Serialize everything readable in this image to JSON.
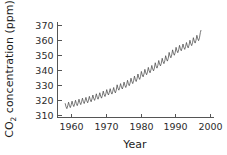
{
  "chart_data": {
    "type": "line",
    "title": "",
    "subtitle": "",
    "xlabel": "Year",
    "ylabel": "CO2 concentration (ppm)",
    "ylabel_main": "CO",
    "ylabel_sub": "2",
    "ylabel_rest": " concentration (ppm)",
    "xlim": [
      1956,
      2001
    ],
    "ylim": [
      308,
      372
    ],
    "xticks": [
      1960,
      1970,
      1980,
      1990,
      2000
    ],
    "yticks": [
      310,
      320,
      330,
      340,
      350,
      360,
      370
    ],
    "xtick_labels": [
      "1960",
      "1970",
      "1980",
      "1990",
      "2000"
    ],
    "ytick_labels": [
      "310",
      "320",
      "330",
      "340",
      "350",
      "360",
      "370"
    ],
    "grid": false,
    "legend": false,
    "legend_position": "none",
    "annotations": [],
    "series": [
      {
        "name": "Atmospheric CO2 (Mauna Loa monthly mean)",
        "color": "#4a4a4a",
        "x_start": 1958.2,
        "x_end": 1997.4,
        "seasonal_amplitude_ppm": 3.1,
        "x": [
          1958.2,
          1958.45,
          1958.7,
          1958.95,
          1959.2,
          1959.45,
          1959.7,
          1959.95,
          1960.2,
          1960.45,
          1960.7,
          1960.95,
          1961.2,
          1961.45,
          1961.7,
          1961.95,
          1962.2,
          1962.45,
          1962.7,
          1962.95,
          1963.2,
          1963.45,
          1963.7,
          1963.95,
          1964.2,
          1964.45,
          1964.7,
          1964.95,
          1965.2,
          1965.45,
          1965.7,
          1965.95,
          1966.2,
          1966.45,
          1966.7,
          1966.95,
          1967.2,
          1967.45,
          1967.7,
          1967.95,
          1968.2,
          1968.45,
          1968.7,
          1968.95,
          1969.2,
          1969.45,
          1969.7,
          1969.95,
          1970.2,
          1970.45,
          1970.7,
          1970.95,
          1971.2,
          1971.45,
          1971.7,
          1971.95,
          1972.2,
          1972.45,
          1972.7,
          1972.95,
          1973.2,
          1973.45,
          1973.7,
          1973.95,
          1974.2,
          1974.45,
          1974.7,
          1974.95,
          1975.2,
          1975.45,
          1975.7,
          1975.95,
          1976.2,
          1976.45,
          1976.7,
          1976.95,
          1977.2,
          1977.45,
          1977.7,
          1977.95,
          1978.2,
          1978.45,
          1978.7,
          1978.95,
          1979.2,
          1979.45,
          1979.7,
          1979.95,
          1980.2,
          1980.45,
          1980.7,
          1980.95,
          1981.2,
          1981.45,
          1981.7,
          1981.95,
          1982.2,
          1982.45,
          1982.7,
          1982.95,
          1983.2,
          1983.45,
          1983.7,
          1983.95,
          1984.2,
          1984.45,
          1984.7,
          1984.95,
          1985.2,
          1985.45,
          1985.7,
          1985.95,
          1986.2,
          1986.45,
          1986.7,
          1986.95,
          1987.2,
          1987.45,
          1987.7,
          1987.95,
          1988.2,
          1988.45,
          1988.7,
          1988.95,
          1989.2,
          1989.45,
          1989.7,
          1989.95,
          1990.2,
          1990.45,
          1990.7,
          1990.95,
          1991.2,
          1991.45,
          1991.7,
          1991.95,
          1992.2,
          1992.45,
          1992.7,
          1992.95,
          1993.2,
          1993.45,
          1993.7,
          1993.95,
          1994.2,
          1994.45,
          1994.7,
          1994.95,
          1995.2,
          1995.45,
          1995.7,
          1995.95,
          1996.2,
          1996.45,
          1996.7,
          1996.95,
          1997.2,
          1997.4
        ],
        "values": [
          317.5,
          315.2,
          313.9,
          315.8,
          318.2,
          315.9,
          314.6,
          316.5,
          318.9,
          316.6,
          315.3,
          317.2,
          319.5,
          317.2,
          315.9,
          317.8,
          320.2,
          317.9,
          316.6,
          318.5,
          320.9,
          318.6,
          317.3,
          319.2,
          321.4,
          319.1,
          317.8,
          319.7,
          322.1,
          319.8,
          318.5,
          320.4,
          323.0,
          320.7,
          319.4,
          321.3,
          323.8,
          321.5,
          320.2,
          322.1,
          324.5,
          322.2,
          320.9,
          322.8,
          325.6,
          323.3,
          322.0,
          323.9,
          326.6,
          324.3,
          323.0,
          324.9,
          327.2,
          324.9,
          323.6,
          325.5,
          328.0,
          325.7,
          324.4,
          326.3,
          329.8,
          327.5,
          326.2,
          328.1,
          330.6,
          328.3,
          327.0,
          328.9,
          331.6,
          329.3,
          328.0,
          329.9,
          332.8,
          330.5,
          329.2,
          331.1,
          334.2,
          331.9,
          330.6,
          332.5,
          335.6,
          333.3,
          332.0,
          333.9,
          337.0,
          334.7,
          333.4,
          335.3,
          338.7,
          336.4,
          335.1,
          337.0,
          340.1,
          337.8,
          336.5,
          338.4,
          341.4,
          339.1,
          337.8,
          339.7,
          342.7,
          340.4,
          339.1,
          341.0,
          344.5,
          342.2,
          340.9,
          342.8,
          346.0,
          343.7,
          342.4,
          344.3,
          347.5,
          345.2,
          343.9,
          345.8,
          349.2,
          346.9,
          345.6,
          347.5,
          351.4,
          349.1,
          347.8,
          349.7,
          353.1,
          350.8,
          349.5,
          351.4,
          354.8,
          352.5,
          351.2,
          353.1,
          356.1,
          353.8,
          352.5,
          354.4,
          357.0,
          354.7,
          353.4,
          355.3,
          358.0,
          355.7,
          354.4,
          356.3,
          359.5,
          357.2,
          355.9,
          357.8,
          361.2,
          358.9,
          357.6,
          359.5,
          362.8,
          360.5,
          359.2,
          361.1,
          364.6,
          366.3
        ]
      }
    ]
  },
  "figure": {
    "background_color": "#ffffff",
    "axis_color": "#555555",
    "text_color": "#2b2b2b",
    "curve_color": "#4a4a4a"
  }
}
